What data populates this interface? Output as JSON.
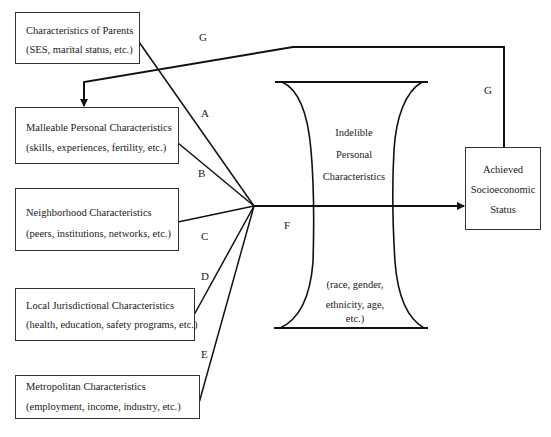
{
  "diagram": {
    "boxes": [
      {
        "id": "parents",
        "title": "Characteristics of Parents",
        "subtitle": "(SES, marital status, etc.)"
      },
      {
        "id": "malleable",
        "title": "Malleable Personal Characteristics",
        "subtitle": "(skills, experiences, fertility, etc.)"
      },
      {
        "id": "neighborhood",
        "title": "Neighborhood Characteristics",
        "subtitle": "(peers, institutions, networks, etc.)"
      },
      {
        "id": "local",
        "title": "Local Jurisdictional Characteristics",
        "subtitle": "(health, education, safety programs, etc.)"
      },
      {
        "id": "metro",
        "title": "Metropolitan Characteristics",
        "subtitle": "(employment, income, industry, etc.)"
      }
    ],
    "indelible": {
      "title_lines": [
        "Indelible",
        "Personal",
        "Characteristics"
      ],
      "detail_lines": [
        "(race, gender,",
        "ethnicity, age,",
        "etc.)"
      ]
    },
    "outcome": {
      "lines": [
        "Achieved",
        "Socioeconomic",
        "Status"
      ]
    },
    "path_labels": {
      "A": "A",
      "B": "B",
      "C": "C",
      "D": "D",
      "E": "E",
      "F": "F",
      "G": "G"
    },
    "edges": [
      {
        "from": "parents",
        "to": "convergence",
        "label": "A"
      },
      {
        "from": "malleable",
        "to": "convergence",
        "label": "B"
      },
      {
        "from": "neighborhood",
        "to": "convergence",
        "label": "C"
      },
      {
        "from": "local",
        "to": "convergence",
        "label": "D"
      },
      {
        "from": "metro",
        "to": "convergence",
        "label": "E"
      },
      {
        "from": "convergence",
        "to": "outcome",
        "label": "F"
      },
      {
        "from": "outcome",
        "to": "malleable",
        "label": "G"
      }
    ]
  }
}
